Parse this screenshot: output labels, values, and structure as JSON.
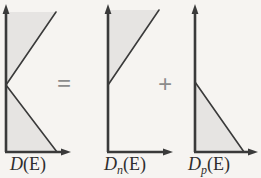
{
  "figure": {
    "kind": "density-of-states-decomposition",
    "equation_text": "D(E) = Dn(E) + Dp(E)",
    "background_color": "#f6f4f1",
    "line_color": "#3a3a3a",
    "fill_color": "#e6e4e2",
    "operators": {
      "equals": "=",
      "plus": "+"
    },
    "panels": [
      {
        "id": "total",
        "label_main": "D",
        "label_sub": "",
        "label_arg": "(E)",
        "description": "Total density of states: V-shaped profile opening to the right, vertex on the energy axis at mid-height",
        "axis_origin": {
          "x": 6,
          "y": 152
        },
        "y_axis_top": {
          "x": 6,
          "y": 6
        },
        "x_axis_right": {
          "x": 70,
          "y": 152
        },
        "vertex": {
          "x": 6,
          "y": 85
        },
        "upper_end": {
          "x": 56,
          "y": 12
        },
        "lower_end": {
          "x": 56,
          "y": 152
        }
      },
      {
        "id": "electrons",
        "label_main": "D",
        "label_sub": "n",
        "label_arg": "(E)",
        "description": "Conduction band (electron) density of states rising linearly above the band edge",
        "axis_origin": {
          "x": 108,
          "y": 152
        },
        "y_axis_top": {
          "x": 108,
          "y": 6
        },
        "x_axis_right": {
          "x": 172,
          "y": 152
        },
        "band_edge": {
          "x": 108,
          "y": 85
        },
        "upper_end": {
          "x": 158,
          "y": 10
        }
      },
      {
        "id": "holes",
        "label_main": "D",
        "label_sub": "p",
        "label_arg": "(E)",
        "description": "Valence band (hole) density of states falling linearly below the band edge",
        "axis_origin": {
          "x": 195,
          "y": 152
        },
        "y_axis_top": {
          "x": 195,
          "y": 6
        },
        "x_axis_right": {
          "x": 257,
          "y": 152
        },
        "band_edge": {
          "x": 195,
          "y": 82
        },
        "lower_end": {
          "x": 243,
          "y": 152
        }
      }
    ]
  }
}
